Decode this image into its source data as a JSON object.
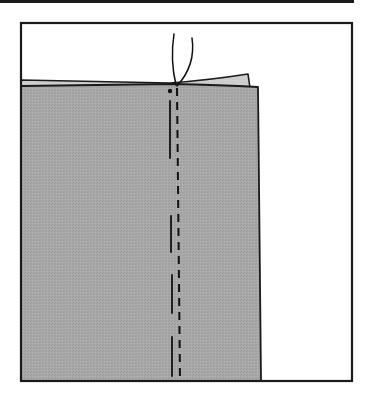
{
  "figure": {
    "colors": {
      "background": "#ffffff",
      "frame": "#1a1a1a",
      "fabric_top": "#a6a6a6",
      "fabric_under": "#cfcfcf",
      "stitch": "#111111"
    },
    "elements": {
      "top_rule": "top-rule",
      "frame": "frame-border",
      "fabric_top_layer": "fabric-top-layer",
      "fabric_under_layer": "fabric-under-layer",
      "thread_ends": "thread-icon",
      "start_dot": "marker-dot",
      "solid_line": "cut-line",
      "dashed_line": "stitch-line"
    }
  }
}
